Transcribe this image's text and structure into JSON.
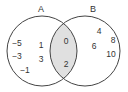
{
  "diagram": {
    "type": "venn",
    "sets": [
      {
        "label": "A",
        "only_elements": [
          "-5",
          "1",
          "-3",
          "3",
          "-1"
        ]
      },
      {
        "label": "B",
        "only_elements": [
          "4",
          "8",
          "6",
          "10"
        ]
      }
    ],
    "intersection": {
      "label": "A ∩ B",
      "elements": [
        "0",
        "2"
      ],
      "shaded": true
    },
    "colors": {
      "stroke": "#444444",
      "intersection_fill": "#e0e0e0",
      "text": "#333333"
    }
  },
  "labels": {
    "a": "A",
    "b": "B"
  },
  "a_only": {
    "n0": "−5",
    "n1": "1",
    "n2": "−3",
    "n3": "3",
    "n4": "−1"
  },
  "both": {
    "n0": "0",
    "n1": "2"
  },
  "b_only": {
    "n0": "4",
    "n1": "8",
    "n2": "6",
    "n3": "10"
  }
}
